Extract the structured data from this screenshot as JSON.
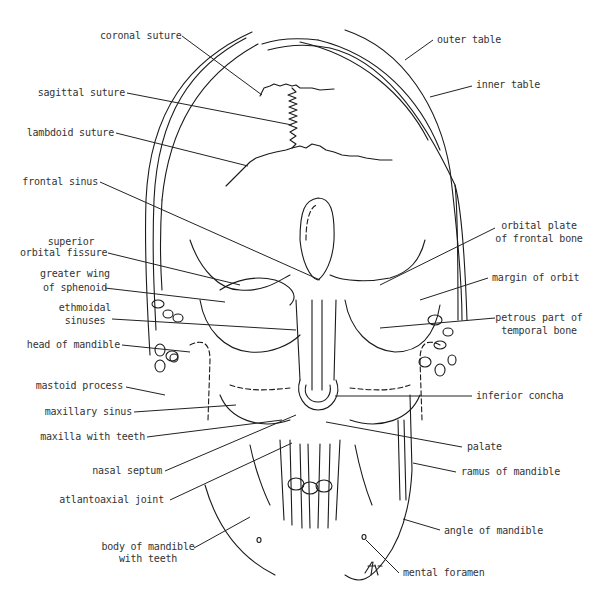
{
  "diagram": {
    "signature": "TMF",
    "labels_left": [
      {
        "id": "coronal-suture",
        "text": "coronal suture"
      },
      {
        "id": "sagittal-suture",
        "text": "sagittal suture"
      },
      {
        "id": "lambdoid-suture",
        "text": "lambdoid suture"
      },
      {
        "id": "frontal-sinus",
        "text": "frontal sinus"
      },
      {
        "id": "superior-orbital-fissure",
        "line1": "superior",
        "line2": "orbital fissure"
      },
      {
        "id": "greater-wing-of-sphenoid",
        "line1": "greater wing",
        "line2": "of sphenoid"
      },
      {
        "id": "ethmoidal-sinuses",
        "line1": "ethmoidal",
        "line2": "sinuses"
      },
      {
        "id": "head-of-mandible",
        "text": "head of mandible"
      },
      {
        "id": "mastoid-process",
        "text": "mastoid process"
      },
      {
        "id": "maxillary-sinus",
        "text": "maxillary sinus"
      },
      {
        "id": "maxilla-with-teeth",
        "text": "maxilla with teeth"
      },
      {
        "id": "nasal-septum",
        "text": "nasal septum"
      },
      {
        "id": "atlantoaxial-joint",
        "text": "atlantoaxial joint"
      },
      {
        "id": "body-of-mandible-with-teeth",
        "line1": "body of mandible",
        "line2": "with teeth"
      }
    ],
    "labels_right": [
      {
        "id": "outer-table",
        "text": "outer table"
      },
      {
        "id": "inner-table",
        "text": "inner table"
      },
      {
        "id": "orbital-plate-of-frontal-bone",
        "line1": "orbital plate",
        "line2": "of frontal bone"
      },
      {
        "id": "margin-of-orbit",
        "text": "margin of orbit"
      },
      {
        "id": "petrous-part-of-temporal-bone",
        "line1": "petrous part of",
        "line2": "temporal bone"
      },
      {
        "id": "inferior-concha",
        "text": "inferior concha"
      },
      {
        "id": "palate",
        "text": "palate"
      },
      {
        "id": "ramus-of-mandible",
        "text": "ramus of mandible"
      },
      {
        "id": "angle-of-mandible",
        "text": "angle of mandible"
      },
      {
        "id": "mental-foramen",
        "text": "mental foramen"
      }
    ]
  }
}
